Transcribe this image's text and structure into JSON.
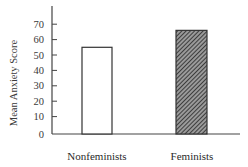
{
  "chart_data": {
    "type": "bar",
    "title": "",
    "xlabel": "",
    "ylabel": "Mean Anxiety Score",
    "categories": [
      "Nonfeminists",
      "Feminists"
    ],
    "values": [
      55,
      66
    ],
    "ylim": [
      0,
      70
    ],
    "yticks": [
      0,
      10,
      20,
      30,
      40,
      50,
      60,
      70
    ],
    "grid": false,
    "legend": null,
    "bar_styles": [
      {
        "category": "Nonfeminists",
        "fill": "#ffffff",
        "pattern": "none"
      },
      {
        "category": "Feminists",
        "fill": "#555555",
        "pattern": "diagonal-hatch"
      }
    ]
  },
  "colors": {
    "axis": "#444444",
    "bar_outline": "#333333",
    "hatch_dark": "#3a3a3a",
    "hatch_light": "#9a9a9a"
  }
}
